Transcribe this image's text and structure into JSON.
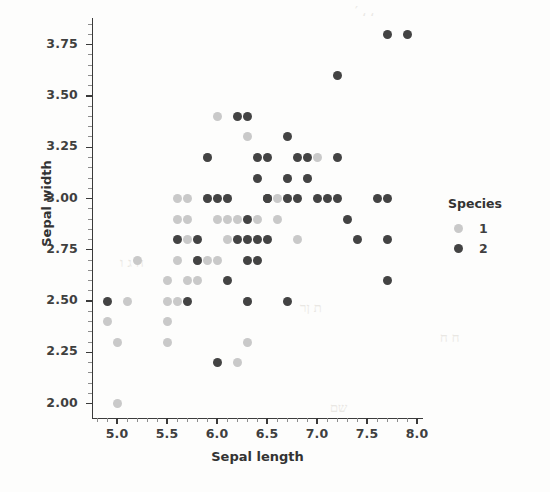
{
  "chart_data": {
    "type": "scatter",
    "title": "",
    "xlabel": "Sepal length",
    "ylabel": "Sepal width",
    "xlim": [
      4.75,
      8.05
    ],
    "ylim": [
      1.93,
      3.88
    ],
    "grid": false,
    "xticks": [
      "5.0",
      "5.5",
      "6.0",
      "6.5",
      "7.0",
      "7.5",
      "8.0"
    ],
    "xtick_values": [
      5.0,
      5.5,
      6.0,
      6.5,
      7.0,
      7.5,
      8.0
    ],
    "yticks": [
      "2.00",
      "2.25",
      "2.50",
      "2.75",
      "3.00",
      "3.25",
      "3.50",
      "3.75"
    ],
    "ytick_values": [
      2.0,
      2.25,
      2.5,
      2.75,
      3.0,
      3.25,
      3.5,
      3.75
    ],
    "legend": {
      "title": "Species",
      "position": "right",
      "entries": [
        {
          "label": "1",
          "color": "#c9c9c9"
        },
        {
          "label": "2",
          "color": "#434343"
        }
      ]
    },
    "series": [
      {
        "name": "1",
        "label": "1",
        "color": "#c9c9c9",
        "points": [
          [
            4.9,
            2.4
          ],
          [
            5.0,
            2.3
          ],
          [
            5.0,
            2.0
          ],
          [
            5.1,
            2.5
          ],
          [
            5.2,
            2.7
          ],
          [
            5.5,
            2.6
          ],
          [
            5.5,
            2.5
          ],
          [
            5.5,
            2.4
          ],
          [
            5.5,
            2.3
          ],
          [
            5.6,
            3.0
          ],
          [
            5.6,
            2.9
          ],
          [
            5.6,
            2.7
          ],
          [
            5.6,
            2.5
          ],
          [
            5.7,
            3.0
          ],
          [
            5.7,
            2.9
          ],
          [
            5.7,
            2.8
          ],
          [
            5.7,
            2.6
          ],
          [
            5.8,
            2.7
          ],
          [
            5.8,
            2.6
          ],
          [
            5.9,
            3.2
          ],
          [
            5.9,
            3.0
          ],
          [
            5.9,
            2.7
          ],
          [
            6.0,
            3.4
          ],
          [
            6.0,
            2.9
          ],
          [
            6.0,
            2.7
          ],
          [
            6.1,
            3.0
          ],
          [
            6.1,
            2.9
          ],
          [
            6.1,
            2.8
          ],
          [
            6.2,
            2.9
          ],
          [
            6.2,
            2.2
          ],
          [
            6.3,
            3.3
          ],
          [
            6.3,
            2.5
          ],
          [
            6.3,
            2.3
          ],
          [
            6.4,
            2.9
          ],
          [
            6.6,
            3.0
          ],
          [
            6.6,
            2.9
          ],
          [
            6.7,
            3.1
          ],
          [
            6.7,
            3.0
          ],
          [
            6.8,
            2.8
          ],
          [
            6.9,
            3.1
          ],
          [
            7.0,
            3.2
          ]
        ]
      },
      {
        "name": "2",
        "label": "2",
        "color": "#434343",
        "points": [
          [
            4.9,
            2.5
          ],
          [
            5.6,
            2.8
          ],
          [
            5.7,
            2.5
          ],
          [
            5.8,
            2.8
          ],
          [
            5.8,
            2.7
          ],
          [
            5.9,
            3.2
          ],
          [
            5.9,
            3.0
          ],
          [
            6.0,
            3.0
          ],
          [
            6.0,
            2.2
          ],
          [
            6.1,
            3.0
          ],
          [
            6.1,
            2.6
          ],
          [
            6.2,
            3.4
          ],
          [
            6.2,
            2.8
          ],
          [
            6.3,
            3.4
          ],
          [
            6.3,
            2.9
          ],
          [
            6.3,
            2.8
          ],
          [
            6.3,
            2.7
          ],
          [
            6.3,
            2.5
          ],
          [
            6.4,
            3.2
          ],
          [
            6.4,
            3.1
          ],
          [
            6.4,
            2.8
          ],
          [
            6.4,
            2.7
          ],
          [
            6.5,
            3.2
          ],
          [
            6.5,
            3.0
          ],
          [
            6.5,
            3.0
          ],
          [
            6.5,
            2.8
          ],
          [
            6.7,
            3.3
          ],
          [
            6.7,
            3.1
          ],
          [
            6.7,
            3.0
          ],
          [
            6.7,
            2.5
          ],
          [
            6.8,
            3.2
          ],
          [
            6.8,
            3.0
          ],
          [
            6.9,
            3.2
          ],
          [
            6.9,
            3.1
          ],
          [
            7.0,
            3.0
          ],
          [
            7.1,
            3.0
          ],
          [
            7.2,
            3.6
          ],
          [
            7.2,
            3.2
          ],
          [
            7.2,
            3.0
          ],
          [
            7.3,
            2.9
          ],
          [
            7.4,
            2.8
          ],
          [
            7.6,
            3.0
          ],
          [
            7.7,
            3.8
          ],
          [
            7.7,
            3.0
          ],
          [
            7.7,
            2.8
          ],
          [
            7.7,
            2.6
          ],
          [
            7.9,
            3.8
          ]
        ]
      }
    ]
  }
}
